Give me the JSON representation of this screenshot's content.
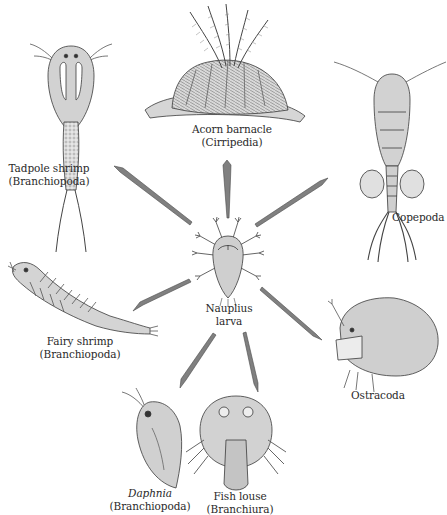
{
  "figure": {
    "center": {
      "name": "Nauplius larva",
      "line1": "Nauplius",
      "line2": "larva"
    },
    "organisms": [
      {
        "id": "acorn-barnacle",
        "common": "Acorn barnacle",
        "group": "(Cirripedia)"
      },
      {
        "id": "tadpole-shrimp",
        "common": "Tadpole shrimp",
        "group": "(Branchiopoda)"
      },
      {
        "id": "copepoda",
        "common": "Copepoda",
        "group": ""
      },
      {
        "id": "fairy-shrimp",
        "common": "Fairy shrimp",
        "group": "(Branchiopoda)"
      },
      {
        "id": "ostracoda",
        "common": "Ostracoda",
        "group": ""
      },
      {
        "id": "daphnia",
        "common": "Daphnia",
        "group": "(Branchiopoda)"
      },
      {
        "id": "fish-louse",
        "common": "Fish louse",
        "group": "(Branchiura)"
      }
    ],
    "colors": {
      "arrow": "#7a7a7a",
      "arrow_edge": "#4a4a4a",
      "body_fill": "#d4d4d4",
      "ink": "#3a3a3a",
      "background": "#ffffff"
    }
  }
}
